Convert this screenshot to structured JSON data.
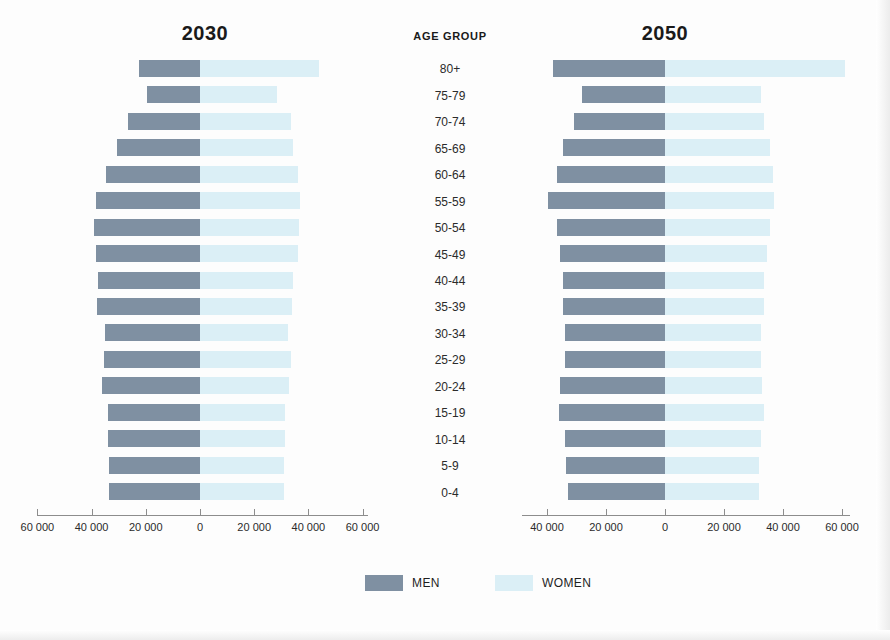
{
  "figure": {
    "age_group_header": "AGE GROUP",
    "legend": {
      "men_label": "MEN",
      "women_label": "WOMEN",
      "men_color": "#7f90a2",
      "women_color": "#dbeff6"
    }
  },
  "chart_data": [
    {
      "type": "bar",
      "title": "2030",
      "subtype": "population-pyramid",
      "xlabel": "",
      "ylabel": "AGE GROUP",
      "categories": [
        "80+",
        "75-79",
        "70-74",
        "65-69",
        "60-64",
        "55-59",
        "50-54",
        "45-49",
        "40-44",
        "35-39",
        "30-34",
        "25-29",
        "20-24",
        "15-19",
        "10-14",
        "5-9",
        "0-4"
      ],
      "series": [
        {
          "name": "MEN",
          "color": "#7f90a2",
          "direction": "left",
          "values": [
            22500,
            19500,
            26500,
            30500,
            34500,
            38500,
            39000,
            38500,
            37500,
            38000,
            35000,
            35500,
            36000,
            34000,
            34000,
            33500,
            33500
          ]
        },
        {
          "name": "WOMEN",
          "color": "#dbeff6",
          "direction": "right",
          "values": [
            44000,
            28500,
            33500,
            34500,
            36000,
            37000,
            36500,
            36000,
            34500,
            34000,
            32500,
            33500,
            33000,
            31500,
            31500,
            31000,
            31000
          ]
        }
      ],
      "xticks": [
        60000,
        40000,
        20000,
        0,
        20000,
        40000,
        60000
      ],
      "xtick_labels": [
        "60 000",
        "40 000",
        "20 000",
        "0",
        "20 000",
        "40 000",
        "60 000"
      ],
      "xlim": [
        -60000,
        60000
      ],
      "grid": false,
      "legend_position": "bottom"
    },
    {
      "type": "bar",
      "title": "2050",
      "subtype": "population-pyramid",
      "xlabel": "",
      "ylabel": "AGE GROUP",
      "categories": [
        "80+",
        "75-79",
        "70-74",
        "65-69",
        "60-64",
        "55-59",
        "50-54",
        "45-49",
        "40-44",
        "35-39",
        "30-34",
        "25-29",
        "20-24",
        "15-19",
        "10-14",
        "5-9",
        "0-4"
      ],
      "series": [
        {
          "name": "MEN",
          "color": "#7f90a2",
          "direction": "left",
          "values": [
            38000,
            28000,
            31000,
            34500,
            36500,
            39500,
            36500,
            35500,
            34500,
            34500,
            34000,
            34000,
            35500,
            36000,
            34000,
            33500,
            33000
          ]
        },
        {
          "name": "WOMEN",
          "color": "#dbeff6",
          "direction": "right",
          "values": [
            61000,
            32500,
            33500,
            35500,
            36500,
            37000,
            35500,
            34500,
            33500,
            33500,
            32500,
            32500,
            33000,
            33500,
            32500,
            32000,
            32000
          ]
        }
      ],
      "xticks": [
        40000,
        20000,
        0,
        20000,
        40000,
        60000
      ],
      "xtick_labels": [
        "40 000",
        "20 000",
        "0",
        "20 000",
        "40 000",
        "60 000"
      ],
      "xlim": [
        -45000,
        62000
      ],
      "grid": false,
      "legend_position": "bottom"
    }
  ]
}
